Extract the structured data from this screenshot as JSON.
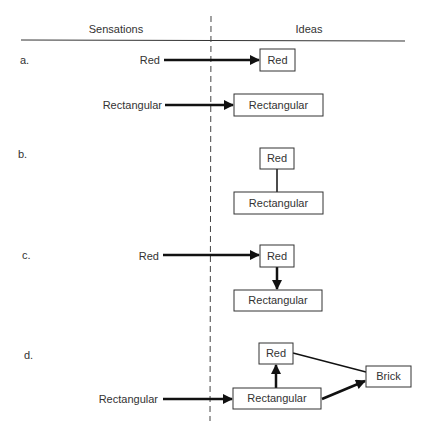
{
  "diagram": {
    "headers": {
      "left": "Sensations",
      "right": "Ideas"
    },
    "panels": [
      {
        "id": "a",
        "label": "a.",
        "sensations": [
          "Red",
          "Rectangular"
        ],
        "ideas": [
          "Red",
          "Rectangular"
        ],
        "edges": [
          {
            "from": "sensation:Red",
            "to": "idea:Red",
            "type": "arrow"
          },
          {
            "from": "sensation:Rectangular",
            "to": "idea:Rectangular",
            "type": "arrow"
          }
        ]
      },
      {
        "id": "b",
        "label": "b.",
        "sensations": [],
        "ideas": [
          "Red",
          "Rectangular"
        ],
        "edges": [
          {
            "from": "idea:Red",
            "to": "idea:Rectangular",
            "type": "line"
          }
        ]
      },
      {
        "id": "c",
        "label": "c.",
        "sensations": [
          "Red"
        ],
        "ideas": [
          "Red",
          "Rectangular"
        ],
        "edges": [
          {
            "from": "sensation:Red",
            "to": "idea:Red",
            "type": "arrow"
          },
          {
            "from": "idea:Red",
            "to": "idea:Rectangular",
            "type": "arrow"
          }
        ]
      },
      {
        "id": "d",
        "label": "d.",
        "sensations": [
          "Rectangular"
        ],
        "ideas": [
          "Red",
          "Rectangular",
          "Brick"
        ],
        "edges": [
          {
            "from": "sensation:Rectangular",
            "to": "idea:Rectangular",
            "type": "arrow"
          },
          {
            "from": "idea:Rectangular",
            "to": "idea:Red",
            "type": "arrow"
          },
          {
            "from": "idea:Rectangular",
            "to": "idea:Brick",
            "type": "arrow"
          },
          {
            "from": "idea:Red",
            "to": "idea:Brick",
            "type": "line"
          }
        ]
      }
    ]
  }
}
